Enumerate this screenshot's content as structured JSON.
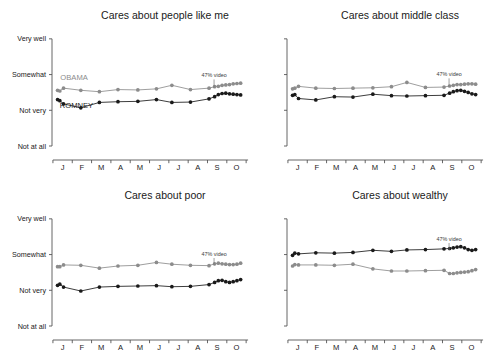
{
  "chart_data": [
    {
      "type": "line",
      "panel_id": "cares-about-people-like-me",
      "title": "Cares about people like me",
      "xlabel": "",
      "ylabel": "",
      "ytick_labels": [
        "Very well",
        "Somewhat",
        "Not very",
        "Not at all"
      ],
      "ytick_values": [
        4,
        3,
        2,
        1
      ],
      "ylim": [
        0.72,
        4.22
      ],
      "xtick_labels": [
        "J",
        "F",
        "M",
        "A",
        "M",
        "J",
        "J",
        "A",
        "S",
        "O"
      ],
      "xlim": [
        0,
        10.6
      ],
      "grid": false,
      "legend_position": "inline-annotation",
      "annotations": [
        {
          "text": "47% video",
          "x": 8.72,
          "y": 2.92,
          "pointer_to_y": 2.63
        }
      ],
      "series": [
        {
          "name": "OBAMA",
          "color": "#8c8c8c",
          "inline_label": "OBAMA",
          "inline_label_x": 0.45,
          "inline_label_y": 2.86,
          "x": [
            0.3,
            0.42,
            0.62,
            1.55,
            2.55,
            3.55,
            4.62,
            5.62,
            6.45,
            7.45,
            8.45,
            8.75,
            8.95,
            9.15,
            9.35,
            9.55,
            9.75,
            9.95,
            10.15
          ],
          "y": [
            2.56,
            2.54,
            2.62,
            2.56,
            2.52,
            2.58,
            2.57,
            2.6,
            2.7,
            2.58,
            2.62,
            2.66,
            2.67,
            2.7,
            2.71,
            2.72,
            2.74,
            2.75,
            2.76
          ]
        },
        {
          "name": "ROMNEY",
          "color": "#1a1a1a",
          "inline_label": "ROMNEY",
          "inline_label_x": 0.42,
          "inline_label_y": 2.06,
          "x": [
            0.3,
            0.42,
            0.62,
            1.55,
            2.55,
            3.55,
            4.62,
            5.62,
            6.45,
            7.45,
            8.45,
            8.75,
            8.95,
            9.15,
            9.35,
            9.55,
            9.75,
            9.95,
            10.15
          ],
          "y": [
            2.3,
            2.27,
            2.18,
            2.07,
            2.22,
            2.24,
            2.25,
            2.3,
            2.22,
            2.23,
            2.32,
            2.38,
            2.44,
            2.47,
            2.48,
            2.46,
            2.45,
            2.44,
            2.43
          ]
        }
      ]
    },
    {
      "type": "line",
      "panel_id": "cares-about-middle-class",
      "title": "Cares about middle class",
      "xlabel": "",
      "ylabel": "",
      "ytick_labels": [
        "Very well",
        "Somewhat",
        "Not very",
        "Not at all"
      ],
      "ytick_values": [
        4,
        3,
        2,
        1
      ],
      "ylim": [
        0.72,
        4.22
      ],
      "xtick_labels": [
        "J",
        "F",
        "M",
        "A",
        "M",
        "J",
        "J",
        "A",
        "S",
        "O"
      ],
      "xlim": [
        0,
        10.6
      ],
      "grid": false,
      "legend_position": "inline-annotation",
      "annotations": [
        {
          "text": "47% video",
          "x": 8.72,
          "y": 2.95,
          "pointer_to_y": 2.66
        }
      ],
      "series": [
        {
          "name": "OBAMA",
          "color": "#8c8c8c",
          "inline_label": "",
          "x": [
            0.3,
            0.42,
            0.62,
            1.55,
            2.55,
            3.55,
            4.62,
            5.62,
            6.45,
            7.45,
            8.45,
            8.75,
            8.95,
            9.15,
            9.35,
            9.55,
            9.75,
            9.95,
            10.15
          ],
          "y": [
            2.6,
            2.62,
            2.67,
            2.62,
            2.61,
            2.62,
            2.63,
            2.66,
            2.78,
            2.64,
            2.65,
            2.68,
            2.7,
            2.72,
            2.72,
            2.73,
            2.74,
            2.74,
            2.73
          ]
        },
        {
          "name": "ROMNEY",
          "color": "#1a1a1a",
          "inline_label": "",
          "x": [
            0.3,
            0.42,
            0.62,
            1.55,
            2.55,
            3.55,
            4.62,
            5.62,
            6.45,
            7.45,
            8.45,
            8.75,
            8.95,
            9.15,
            9.35,
            9.55,
            9.75,
            9.95,
            10.15
          ],
          "y": [
            2.42,
            2.44,
            2.33,
            2.29,
            2.38,
            2.37,
            2.45,
            2.41,
            2.4,
            2.41,
            2.42,
            2.48,
            2.52,
            2.55,
            2.56,
            2.53,
            2.5,
            2.46,
            2.44
          ]
        }
      ]
    },
    {
      "type": "line",
      "panel_id": "cares-about-poor",
      "title": "Cares about poor",
      "xlabel": "",
      "ylabel": "",
      "ytick_labels": [
        "Very well",
        "Somewhat",
        "Not very",
        "Not at all"
      ],
      "ytick_values": [
        4,
        3,
        2,
        1
      ],
      "ylim": [
        0.72,
        4.22
      ],
      "xtick_labels": [
        "J",
        "F",
        "M",
        "A",
        "M",
        "J",
        "J",
        "A",
        "S",
        "O"
      ],
      "xlim": [
        0,
        10.6
      ],
      "grid": false,
      "legend_position": "inline-annotation",
      "annotations": [
        {
          "text": "47% video",
          "x": 8.72,
          "y": 2.96,
          "pointer_to_y": 2.7
        }
      ],
      "series": [
        {
          "name": "OBAMA",
          "color": "#8c8c8c",
          "inline_label": "",
          "x": [
            0.3,
            0.42,
            0.62,
            1.55,
            2.55,
            3.55,
            4.62,
            5.62,
            6.45,
            7.45,
            8.45,
            8.75,
            8.95,
            9.15,
            9.35,
            9.55,
            9.75,
            9.95,
            10.15
          ],
          "y": [
            2.66,
            2.66,
            2.71,
            2.7,
            2.62,
            2.68,
            2.7,
            2.78,
            2.73,
            2.7,
            2.69,
            2.74,
            2.76,
            2.74,
            2.73,
            2.72,
            2.72,
            2.73,
            2.76
          ]
        },
        {
          "name": "ROMNEY",
          "color": "#1a1a1a",
          "inline_label": "",
          "x": [
            0.3,
            0.42,
            0.62,
            1.55,
            2.55,
            3.55,
            4.62,
            5.62,
            6.45,
            7.45,
            8.45,
            8.75,
            8.95,
            9.15,
            9.35,
            9.55,
            9.75,
            9.95,
            10.15
          ],
          "y": [
            2.14,
            2.17,
            2.09,
            1.98,
            2.09,
            2.11,
            2.12,
            2.13,
            2.1,
            2.11,
            2.16,
            2.22,
            2.27,
            2.28,
            2.24,
            2.22,
            2.24,
            2.27,
            2.3
          ]
        }
      ]
    },
    {
      "type": "line",
      "panel_id": "cares-about-wealthy",
      "title": "Cares about wealthy",
      "xlabel": "",
      "ylabel": "",
      "ytick_labels": [
        "Very well",
        "Somewhat",
        "Not very",
        "Not at all"
      ],
      "ytick_values": [
        4,
        3,
        2,
        1
      ],
      "ylim": [
        0.72,
        4.22
      ],
      "xtick_labels": [
        "J",
        "F",
        "M",
        "A",
        "M",
        "J",
        "J",
        "A",
        "S",
        "O"
      ],
      "xlim": [
        0,
        10.6
      ],
      "grid": false,
      "legend_position": "inline-annotation",
      "annotations": [
        {
          "text": "47% video",
          "x": 8.72,
          "y": 3.38,
          "pointer_to_y": 3.12
        }
      ],
      "series": [
        {
          "name": "ROMNEY",
          "color": "#1a1a1a",
          "inline_label": "",
          "x": [
            0.3,
            0.42,
            0.62,
            1.55,
            2.55,
            3.55,
            4.62,
            5.62,
            6.45,
            7.45,
            8.45,
            8.75,
            8.95,
            9.15,
            9.35,
            9.55,
            9.75,
            9.95,
            10.15
          ],
          "y": [
            2.98,
            3.04,
            3.02,
            3.05,
            3.04,
            3.06,
            3.12,
            3.09,
            3.13,
            3.14,
            3.16,
            3.17,
            3.19,
            3.21,
            3.22,
            3.19,
            3.14,
            3.12,
            3.14
          ]
        },
        {
          "name": "OBAMA",
          "color": "#8c8c8c",
          "inline_label": "",
          "x": [
            0.3,
            0.42,
            0.62,
            1.55,
            2.55,
            3.55,
            4.62,
            5.62,
            6.45,
            7.45,
            8.45,
            8.75,
            8.95,
            9.15,
            9.35,
            9.55,
            9.75,
            9.95,
            10.15
          ],
          "y": [
            2.68,
            2.72,
            2.71,
            2.71,
            2.7,
            2.73,
            2.6,
            2.54,
            2.54,
            2.55,
            2.56,
            2.47,
            2.47,
            2.49,
            2.5,
            2.51,
            2.52,
            2.55,
            2.58
          ]
        }
      ]
    }
  ]
}
